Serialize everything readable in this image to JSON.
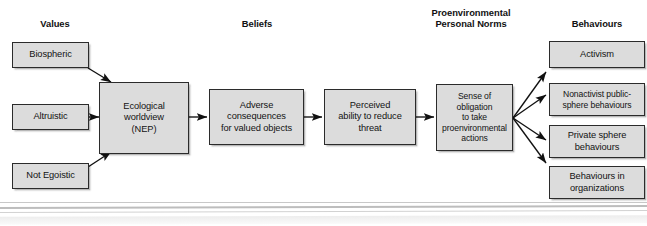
{
  "figure": {
    "type": "flow-diagram"
  },
  "headers": [
    {
      "id": "values",
      "label": "Values"
    },
    {
      "id": "beliefs",
      "label": "Beliefs"
    },
    {
      "id": "norms",
      "label": "Proenvironmental\nPersonal Norms"
    },
    {
      "id": "behaviours",
      "label": "Behaviours"
    }
  ],
  "header_lines": {
    "norms_line1": "Proenvironmental",
    "norms_line2": "Personal Norms"
  },
  "values_nodes": [
    {
      "id": "biospheric",
      "label": "Biospheric"
    },
    {
      "id": "altruistic",
      "label": "Altruistic"
    },
    {
      "id": "not-egoistic",
      "label": "Not Egoistic"
    }
  ],
  "chain_nodes": [
    {
      "id": "ecological-worldview",
      "lines": [
        "Ecological",
        "worldview",
        "(NEP)"
      ]
    },
    {
      "id": "adverse-consequences",
      "lines": [
        "Adverse",
        "consequences",
        "for valued objects"
      ]
    },
    {
      "id": "perceived-ability",
      "lines": [
        "Perceived",
        "ability to reduce",
        "threat"
      ]
    },
    {
      "id": "sense-of-obligation",
      "lines": [
        "Sense of obligation",
        "to take",
        "proenvironmental",
        "actions"
      ]
    }
  ],
  "behaviour_nodes": [
    {
      "id": "activism",
      "lines": [
        "Activism"
      ]
    },
    {
      "id": "nonactivist-public-sphere",
      "lines": [
        "Nonactivist public-",
        "sphere behaviours"
      ]
    },
    {
      "id": "private-sphere",
      "lines": [
        "Private sphere",
        "behaviours"
      ]
    },
    {
      "id": "behaviours-in-organizations",
      "lines": [
        "Behaviours in",
        "organizations"
      ]
    }
  ],
  "colors": {
    "node_fill": "#dcdcdc",
    "node_border": "#2b2b2b",
    "arrow": "#111111",
    "text": "#131313",
    "background": "#ffffff"
  }
}
